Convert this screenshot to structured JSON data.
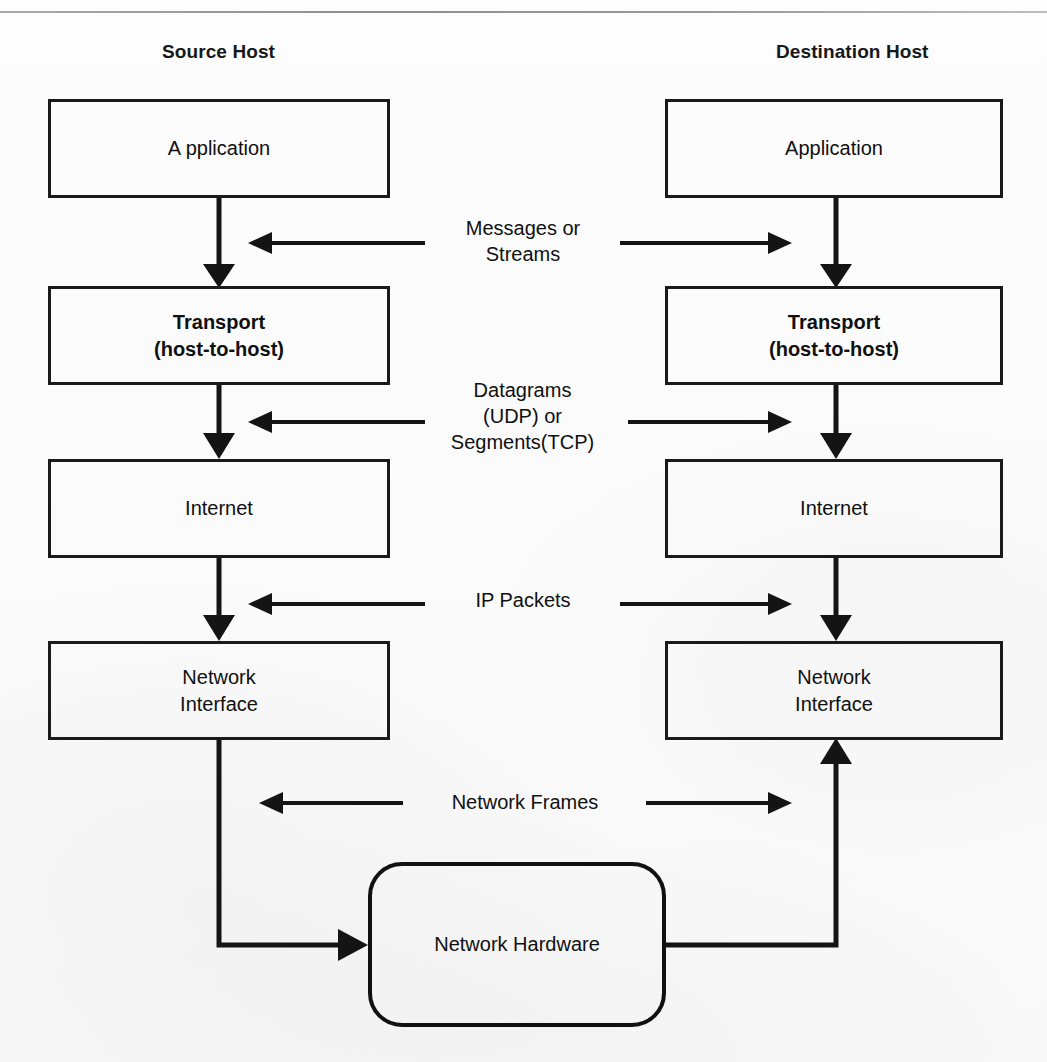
{
  "page": {
    "background_color": "#fdfdfd",
    "line_color": "#141414",
    "rule_color": "#9b9b9b"
  },
  "columns": [
    {
      "id": "source",
      "title": "Source Host"
    },
    {
      "id": "destination",
      "title": "Destination Host"
    }
  ],
  "source_stack": [
    {
      "id": "application",
      "label": "A pplication",
      "bold": false
    },
    {
      "id": "transport",
      "label": "Transport\n(host-to-host)",
      "bold": true
    },
    {
      "id": "internet",
      "label": "Internet",
      "bold": false
    },
    {
      "id": "network-interface",
      "label": "Network\nInterface",
      "bold": false
    }
  ],
  "destination_stack": [
    {
      "id": "application",
      "label": "Application",
      "bold": false
    },
    {
      "id": "transport",
      "label": "Transport\n(host-to-host)",
      "bold": true
    },
    {
      "id": "internet",
      "label": "Internet",
      "bold": false
    },
    {
      "id": "network-interface",
      "label": "Network\nInterface",
      "bold": false
    }
  ],
  "pdu_labels": [
    {
      "id": "messages-or-streams",
      "label": "Messages or\nStreams",
      "between": "application-transport"
    },
    {
      "id": "datagrams-segments",
      "label": "Datagrams\n(UDP) or\nSegments(TCP)",
      "between": "transport-internet"
    },
    {
      "id": "ip-packets",
      "label": "IP Packets",
      "between": "internet-network-interface"
    },
    {
      "id": "network-frames",
      "label": "Network Frames",
      "between": "network-interface-hardware"
    }
  ],
  "hardware": {
    "id": "network-hardware",
    "label": "Network Hardware"
  },
  "flow_arrows": {
    "source_downward": "Application -> Transport -> Internet -> Network Interface -> Network Hardware",
    "destination_downward": "Application -> Transport -> Internet",
    "destination_upward": "Network Hardware -> Network Interface",
    "peer_left_arrows": 4,
    "peer_right_arrows": 4
  }
}
